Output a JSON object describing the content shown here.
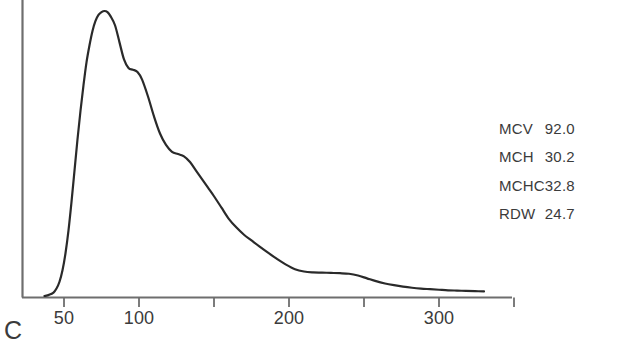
{
  "panel": {
    "label": "C"
  },
  "chart_data": {
    "type": "line",
    "title": "",
    "subtitle": "",
    "xlabel": "",
    "ylabel": "",
    "grid": false,
    "legend_position": "right",
    "xlim": [
      22,
      372
    ],
    "ylim": [
      0,
      100
    ],
    "x_ticks": [
      50,
      100,
      150,
      200,
      250,
      300,
      350
    ],
    "x_tick_labels": [
      "50",
      "100",
      "",
      "200",
      "",
      "300",
      ""
    ],
    "y_ticks": [],
    "y_tick_labels": [],
    "series": [
      {
        "name": "RBC volume distribution",
        "x": [
          37,
          40,
          43,
          45,
          47,
          49,
          51,
          53,
          55,
          57,
          59,
          61,
          63,
          65,
          67,
          69,
          71,
          73,
          75,
          77,
          79,
          81,
          84,
          87,
          90,
          93,
          96,
          99,
          102,
          106,
          110,
          114,
          118,
          122,
          126,
          130,
          134,
          138,
          142,
          146,
          150,
          155,
          160,
          165,
          170,
          175,
          180,
          186,
          192,
          198,
          204,
          210,
          216,
          222,
          228,
          234,
          240,
          246,
          252,
          258,
          264,
          270,
          276,
          282,
          288,
          294,
          300,
          306,
          312,
          318,
          324,
          330
        ],
        "y": [
          0.0,
          0.4,
          1.2,
          2.6,
          5.0,
          9.0,
          15.0,
          23.0,
          33.0,
          44.0,
          55.0,
          65.0,
          74.0,
          82.0,
          88.0,
          93.0,
          96.5,
          98.6,
          99.6,
          100.0,
          99.6,
          98.2,
          95.0,
          89.0,
          83.0,
          80.0,
          79.4,
          78.6,
          76.0,
          70.0,
          63.0,
          57.0,
          53.0,
          50.6,
          49.8,
          49.0,
          47.0,
          44.0,
          41.0,
          38.0,
          35.0,
          31.0,
          27.0,
          24.0,
          21.5,
          19.5,
          17.5,
          15.2,
          13.0,
          11.0,
          9.4,
          8.6,
          8.3,
          8.2,
          8.1,
          8.0,
          7.8,
          7.2,
          6.2,
          5.2,
          4.4,
          3.8,
          3.3,
          2.9,
          2.6,
          2.4,
          2.2,
          2.0,
          1.9,
          1.8,
          1.7,
          1.6
        ]
      }
    ],
    "annotations": [
      {
        "name": "panel-letter",
        "text": "C"
      }
    ]
  },
  "stats": {
    "rows": [
      {
        "key": "MCV",
        "value": "92.0"
      },
      {
        "key": "MCH",
        "value": "30.2"
      },
      {
        "key": "MCHC",
        "value": "32.8"
      },
      {
        "key": "RDW",
        "value": "24.7"
      }
    ]
  },
  "style": {
    "line_color": "#2a2a2a",
    "axis_color": "#6e6e6e",
    "text_color": "#3b3b3b",
    "background": "#ffffff"
  }
}
